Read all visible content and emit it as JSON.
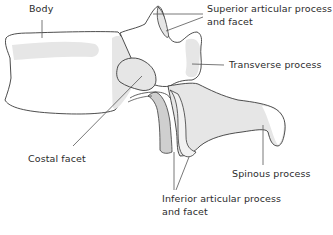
{
  "diagram": {
    "colors": {
      "outline": "#3a3a3a",
      "light_shade": "#e6e6e6",
      "dark_shade": "#cfcfcf",
      "leader_line": "#555555",
      "text": "#2b2b2b"
    },
    "labels": {
      "body": {
        "lines": [
          "Body"
        ]
      },
      "superior_articular": {
        "lines": [
          "Superior articular process",
          "and facet"
        ]
      },
      "transverse": {
        "lines": [
          "Transverse process"
        ]
      },
      "costal_facet": {
        "lines": [
          "Costal facet"
        ]
      },
      "spinous": {
        "lines": [
          "Spinous process"
        ]
      },
      "inferior_articular": {
        "lines": [
          "Inferior articular process",
          "and facet"
        ]
      }
    }
  }
}
